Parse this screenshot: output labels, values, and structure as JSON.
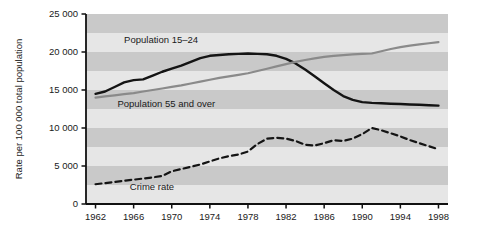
{
  "chart_data": {
    "type": "line",
    "title": "",
    "xlabel": "",
    "ylabel": "Rate per 100 000 total population",
    "xlim": [
      1961,
      1999
    ],
    "ylim": [
      0,
      25000
    ],
    "grid": "horizontal-bands",
    "legend_position": "inline-annotations",
    "x_ticks": [
      "1962",
      "1966",
      "1970",
      "1974",
      "1978",
      "1982",
      "1986",
      "1990",
      "1994",
      "1998"
    ],
    "x_tick_values": [
      1962,
      1966,
      1970,
      1974,
      1978,
      1982,
      1986,
      1990,
      1994,
      1998
    ],
    "y_ticks": [
      "0",
      "5 000",
      "10 000",
      "15 000",
      "20 000",
      "25 000"
    ],
    "y_tick_values": [
      0,
      5000,
      10000,
      15000,
      20000,
      25000
    ],
    "x": [
      1962,
      1963,
      1964,
      1965,
      1966,
      1967,
      1968,
      1969,
      1970,
      1971,
      1972,
      1973,
      1974,
      1975,
      1976,
      1977,
      1978,
      1979,
      1980,
      1981,
      1982,
      1983,
      1984,
      1985,
      1986,
      1987,
      1988,
      1989,
      1990,
      1991,
      1992,
      1993,
      1994,
      1995,
      1996,
      1997,
      1998
    ],
    "series": [
      {
        "name": "Population 15-24",
        "label": "Population 15–24",
        "color": "#141414",
        "style": "solid",
        "width": 2.4,
        "values": [
          14500,
          14800,
          15400,
          16000,
          16300,
          16400,
          16900,
          17400,
          17800,
          18200,
          18700,
          19200,
          19500,
          19600,
          19700,
          19750,
          19800,
          19750,
          19700,
          19500,
          19100,
          18500,
          17700,
          16800,
          15900,
          15000,
          14200,
          13700,
          13400,
          13300,
          13250,
          13200,
          13150,
          13100,
          13050,
          13000,
          12950
        ]
      },
      {
        "name": "Population 55 and over",
        "label": "Population 55 and over",
        "color": "#8a8a8a",
        "style": "solid",
        "width": 2.2,
        "values": [
          14000,
          14150,
          14300,
          14450,
          14600,
          14800,
          15000,
          15200,
          15400,
          15600,
          15850,
          16100,
          16350,
          16600,
          16800,
          17000,
          17200,
          17500,
          17800,
          18100,
          18400,
          18700,
          18950,
          19150,
          19350,
          19500,
          19600,
          19700,
          19750,
          19800,
          20100,
          20400,
          20650,
          20850,
          21000,
          21150,
          21300
        ]
      },
      {
        "name": "Crime rate",
        "label": "Crime rate",
        "color": "#141414",
        "style": "dashed",
        "width": 2.2,
        "values": [
          2600,
          2750,
          2900,
          3050,
          3200,
          3350,
          3500,
          3700,
          4300,
          4600,
          4900,
          5200,
          5600,
          6000,
          6300,
          6500,
          6900,
          7900,
          8600,
          8700,
          8600,
          8300,
          7800,
          7700,
          8000,
          8400,
          8300,
          8600,
          9200,
          10000,
          9700,
          9300,
          8900,
          8400,
          8000,
          7600,
          7200
        ]
      }
    ],
    "annotations": [
      {
        "text": "Population 15–24",
        "x": 1965.0,
        "y": 21200
      },
      {
        "text": "Population 55 and over",
        "x": 1964.3,
        "y": 12700
      },
      {
        "text": "Crime rate",
        "x": 1965.6,
        "y": 1900
      }
    ],
    "band_color_dark": "#c9c9c9",
    "band_color_light": "#e6e6e6",
    "axis_color": "#111111",
    "plot_background": "#e6e6e6"
  }
}
